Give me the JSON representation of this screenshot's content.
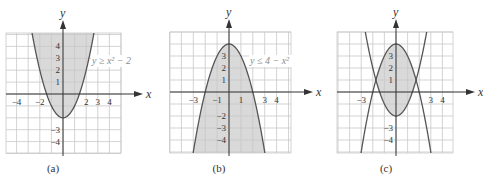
{
  "colors": {
    "grid": "#c8c8c8",
    "grid_bg": "#ffffff",
    "axis": "#333333",
    "curve": "#555555",
    "shade": "#d9d9d9",
    "tick_label": "#333333",
    "ineq_label": "#8a8a8a"
  },
  "panels": [
    {
      "id": "a",
      "caption": "(a)",
      "caption_pos": [
        53,
        162
      ],
      "grid": {
        "x0": 6,
        "x1": 121,
        "y0": 33,
        "y1": 153,
        "ox": 63,
        "oy": 94,
        "sx": 11.6,
        "sy": 11.9
      },
      "axis_labels": {
        "x": "x",
        "y": "y"
      },
      "x_ticks": [
        {
          "value": -4,
          "label": "−4"
        },
        {
          "value": -2,
          "label": "−2"
        },
        {
          "value": 2,
          "label": "2"
        },
        {
          "value": 3,
          "label": "3"
        },
        {
          "value": 4,
          "label": "4"
        }
      ],
      "y_ticks": [
        {
          "value": 4,
          "label": "4"
        },
        {
          "value": 3,
          "label": "3"
        },
        {
          "value": 2,
          "label": "2"
        },
        {
          "value": 1,
          "label": "1"
        },
        {
          "value": -3,
          "label": "−3"
        },
        {
          "value": -4,
          "label": "−4"
        }
      ],
      "inequality": {
        "text": "y ≥ x² − 2",
        "pos": [
          92,
          64
        ]
      },
      "curves": [
        {
          "a": 1,
          "c": -2
        }
      ],
      "shade": "above",
      "x_range": [
        -2.65,
        2.65
      ]
    },
    {
      "id": "b",
      "caption": "(b)",
      "caption_pos": [
        219,
        162
      ],
      "grid": {
        "x0": 170,
        "x1": 291,
        "y0": 32,
        "y1": 153,
        "ox": 229,
        "oy": 92,
        "sx": 11.9,
        "sy": 12.0
      },
      "axis_labels": {
        "x": "x",
        "y": "y"
      },
      "x_ticks": [
        {
          "value": -3,
          "label": "−3"
        },
        {
          "value": -1,
          "label": "−1"
        },
        {
          "value": 1,
          "label": "1"
        },
        {
          "value": 3,
          "label": "3"
        },
        {
          "value": 4,
          "label": "4"
        }
      ],
      "y_ticks": [
        {
          "value": 3,
          "label": "3"
        },
        {
          "value": 2,
          "label": "2"
        },
        {
          "value": 1,
          "label": "1"
        },
        {
          "value": -2,
          "label": "−2"
        },
        {
          "value": -3,
          "label": "−3"
        },
        {
          "value": -4,
          "label": "−4"
        }
      ],
      "inequality": {
        "text": "y ≤ 4 − x²",
        "pos": [
          250,
          64
        ]
      },
      "curves": [
        {
          "a": -1,
          "c": 4
        }
      ],
      "shade": "below",
      "x_range": [
        -2.95,
        2.95
      ]
    },
    {
      "id": "c",
      "caption": "(c)",
      "caption_pos": [
        386,
        162
      ],
      "grid": {
        "x0": 337,
        "x1": 453,
        "y0": 32,
        "y1": 153,
        "ox": 396,
        "oy": 92,
        "sx": 11.6,
        "sy": 12.0
      },
      "axis_labels": {
        "x": "x",
        "y": "y"
      },
      "x_ticks": [
        {
          "value": -3,
          "label": "−3"
        },
        {
          "value": 3,
          "label": "3"
        },
        {
          "value": 4,
          "label": "4"
        }
      ],
      "y_ticks": [
        {
          "value": 3,
          "label": "3"
        },
        {
          "value": 2,
          "label": "2"
        },
        {
          "value": 1,
          "label": "1"
        },
        {
          "value": -3,
          "label": "−3"
        },
        {
          "value": -4,
          "label": "−4"
        }
      ],
      "inequality": null,
      "curves": [
        {
          "a": 1,
          "c": -2
        },
        {
          "a": -1,
          "c": 4
        }
      ],
      "shade": "between",
      "x_range": [
        -2.95,
        2.95
      ]
    }
  ]
}
